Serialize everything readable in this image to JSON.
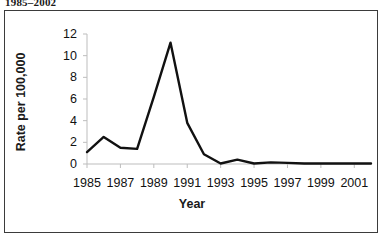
{
  "caption_fragment": "1985–2002",
  "chart_data": {
    "type": "line",
    "title": "",
    "xlabel": "Year",
    "ylabel": "Rate per 100,000",
    "grid": false,
    "legend": "none",
    "xlim": [
      1985,
      2002
    ],
    "ylim": [
      0,
      12
    ],
    "ytick_labels": [
      "12",
      "10",
      "8",
      "6",
      "4",
      "2",
      "0"
    ],
    "yticks": [
      12,
      10,
      8,
      6,
      4,
      2,
      0
    ],
    "xtick_labels": [
      "1985",
      "1987",
      "1989",
      "1991",
      "1993",
      "1995",
      "1997",
      "1999",
      "2001"
    ],
    "xticks": [
      1985,
      1987,
      1989,
      1991,
      1993,
      1995,
      1997,
      1999,
      2001
    ],
    "x": [
      1985,
      1986,
      1987,
      1988,
      1989,
      1990,
      1991,
      1992,
      1993,
      1994,
      1995,
      1996,
      1997,
      1998,
      1999,
      2000,
      2001,
      2002
    ],
    "values": [
      1.1,
      2.5,
      1.5,
      1.4,
      6.2,
      11.2,
      3.8,
      0.9,
      0.05,
      0.4,
      0.05,
      0.15,
      0.1,
      0.05,
      0.05,
      0.05,
      0.05,
      0.05
    ],
    "series": [
      {
        "name": "Rate per 100,000",
        "color": "#111111",
        "values": [
          1.1,
          2.5,
          1.5,
          1.4,
          6.2,
          11.2,
          3.8,
          0.9,
          0.05,
          0.4,
          0.05,
          0.15,
          0.1,
          0.05,
          0.05,
          0.05,
          0.05,
          0.05
        ]
      }
    ]
  }
}
